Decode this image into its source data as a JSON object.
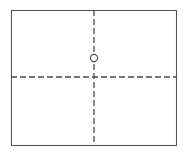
{
  "canvas": {
    "width": 188,
    "height": 159,
    "background_color": "#ffffff"
  },
  "drawing": {
    "title": "rectangular-outline-with-centerlines",
    "description": "Engineering sketch: rectangular plate outline with horizontal and vertical dashed centerlines and a small circular hole marker on the vertical centerline",
    "outline": {
      "name": "plate-outline",
      "shape": "rectangle",
      "x": 11.5,
      "y": 10.5,
      "width": 165,
      "height": 135,
      "stroke_color": "#575757",
      "stroke_width": 1.1,
      "fill": "none"
    },
    "vertical_centerline": {
      "name": "vertical-centerline",
      "x": 94,
      "y1": 10,
      "y2": 146,
      "stroke_color": "#4a4a4a",
      "stroke_width": 1.3,
      "dash_pattern": "6,3"
    },
    "horizontal_centerline": {
      "name": "horizontal-centerline",
      "y": 77,
      "x1": 11,
      "x2": 177,
      "stroke_color": "#4a4a4a",
      "stroke_width": 1.3,
      "dash_pattern": "6,3"
    },
    "hole_marker": {
      "name": "hole-marker",
      "shape": "circle",
      "cx": 94,
      "cy": 58,
      "r": 3.6,
      "stroke_color": "#4a4a4a",
      "stroke_width": 1.1,
      "fill_color": "#ffffff"
    },
    "centerline_intersection": {
      "x": 94,
      "y": 77
    }
  }
}
